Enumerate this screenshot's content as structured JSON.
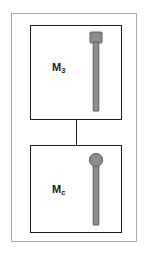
{
  "figure": {
    "type": "schematic-diagram",
    "background_color": "#ffffff",
    "outer_frame": {
      "border_color": "#a8a8a8",
      "fill_color": "#ffffff"
    },
    "connector": {
      "orientation": "vertical",
      "color": "#1c1c1c"
    },
    "modules": [
      {
        "id": "module-top",
        "label_main": "M",
        "label_subscript": "3",
        "label_full": "M3",
        "border_color": "#1c1c1c",
        "fill_color": "#ffffff",
        "icon": {
          "name": "flat-head-pin-icon",
          "head_shape": "rectangular",
          "fill_color": "#8c8c8c",
          "stroke_color": "#5a5a5a"
        }
      },
      {
        "id": "module-bottom",
        "label_main": "M",
        "label_subscript": "c",
        "label_full": "Mc",
        "border_color": "#1c1c1c",
        "fill_color": "#ffffff",
        "icon": {
          "name": "round-head-pin-icon",
          "head_shape": "circular",
          "fill_color": "#8c8c8c",
          "stroke_color": "#5a5a5a"
        }
      }
    ]
  }
}
